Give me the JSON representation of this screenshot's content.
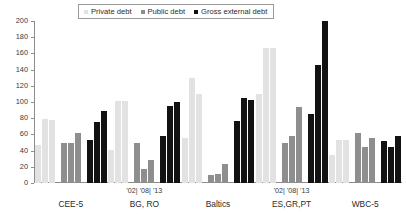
{
  "chart_data": {
    "type": "bar",
    "title": "",
    "xlabel": "",
    "ylabel": "",
    "ylim": [
      0,
      200
    ],
    "yticks": [
      0,
      20,
      40,
      60,
      80,
      100,
      120,
      140,
      160,
      180,
      200
    ],
    "grid": false,
    "legend_position": "top-center",
    "categories": [
      "CEE-5",
      "BG, RO",
      "Baltics",
      "ES,GR,PT",
      "WBC-5"
    ],
    "sub_categories": [
      "'02",
      "'08",
      "'13"
    ],
    "sub_category_label": "'02| '08| '13",
    "series": [
      {
        "name": "Private debt",
        "color": "#e2e2e2",
        "values": {
          "CEE-5": [
            47,
            79,
            78
          ],
          "BG, RO": [
            41,
            101,
            101
          ],
          "Baltics": [
            55,
            130,
            110
          ],
          "ES,GR,PT": [
            110,
            167,
            167
          ],
          "WBC-5": [
            35,
            53,
            53
          ]
        }
      },
      {
        "name": "Public debt",
        "color": "#8e8e8e",
        "values": {
          "CEE-5": [
            50,
            50,
            62
          ],
          "BG, RO": [
            49,
            17,
            28
          ],
          "Baltics": [
            10,
            11,
            24
          ],
          "ES,GR,PT": [
            49,
            58,
            94
          ],
          "WBC-5": [
            62,
            44,
            55
          ]
        }
      },
      {
        "name": "Gross external debt",
        "color": "#121212",
        "values": {
          "CEE-5": [
            53,
            75,
            89
          ],
          "BG, RO": [
            58,
            95,
            100
          ],
          "Baltics": [
            77,
            105,
            102
          ],
          "ES,GR,PT": [
            85,
            146,
            200
          ],
          "WBC-5": [
            52,
            44,
            58
          ]
        }
      }
    ]
  }
}
